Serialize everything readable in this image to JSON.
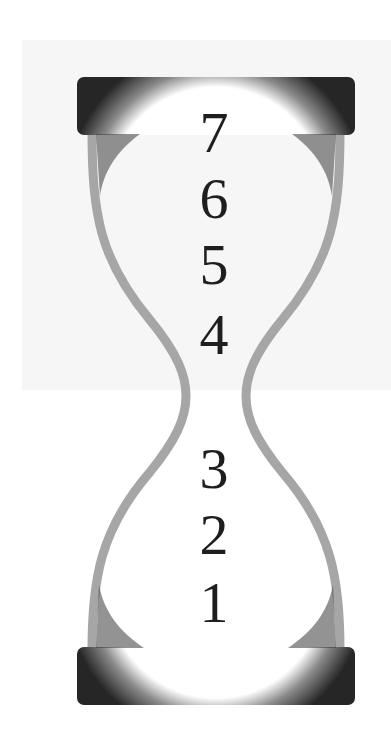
{
  "diagram": {
    "type": "hourglass",
    "colors": {
      "cap": "#262626",
      "wall": "#a4a4a4",
      "bulb": "#ffffff",
      "digit": "#1e1e1e",
      "background_panel": "#f6f6f6"
    },
    "upper_bulb": {
      "labels": [
        "7",
        "6",
        "5",
        "4"
      ]
    },
    "lower_bulb": {
      "labels": [
        "3",
        "2",
        "1"
      ]
    }
  },
  "labels": [
    {
      "text": "7",
      "top": 104
    },
    {
      "text": "6",
      "top": 170
    },
    {
      "text": "5",
      "top": 236
    },
    {
      "text": "4",
      "top": 306
    },
    {
      "text": "3",
      "top": 440
    },
    {
      "text": "2",
      "top": 506
    },
    {
      "text": "1",
      "top": 574
    }
  ]
}
